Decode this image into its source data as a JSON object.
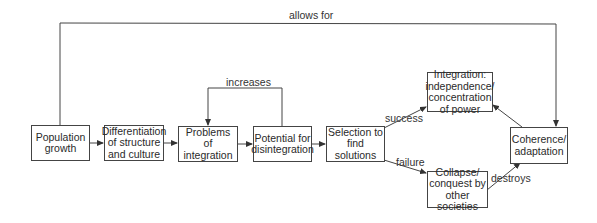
{
  "diagram": {
    "type": "flowchart",
    "nodes": {
      "population": "Population growth",
      "differentiation": "Differentiation of structure and culture",
      "problems": "Problems of integration",
      "potential": "Potential for disintegration",
      "selection": "Selection to find solutions",
      "integration": "Integration: independence/ concentration of power",
      "coherence": "Coherence/ adaptation",
      "collapse": "Collapse/ conquest by other societies"
    },
    "edge_labels": {
      "allows_for": "allows for",
      "increases": "increases",
      "success": "success",
      "failure": "failure",
      "destroys": "destroys"
    },
    "edges": [
      {
        "from": "Population growth",
        "to": "Differentiation of structure and culture"
      },
      {
        "from": "Differentiation of structure and culture",
        "to": "Problems of integration"
      },
      {
        "from": "Problems of integration",
        "to": "Potential for disintegration"
      },
      {
        "from": "Potential for disintegration",
        "to": "Problems of integration",
        "label": "increases"
      },
      {
        "from": "Potential for disintegration",
        "to": "Selection to find solutions"
      },
      {
        "from": "Selection to find solutions",
        "to": "Integration: independence/ concentration of power",
        "label": "success"
      },
      {
        "from": "Selection to find solutions",
        "to": "Collapse/ conquest by other societies",
        "label": "failure"
      },
      {
        "from": "Population growth",
        "to": "Coherence/ adaptation",
        "label": "allows for"
      },
      {
        "from": "Coherence/ adaptation",
        "to": "Integration: independence/ concentration of power"
      },
      {
        "from": "Collapse/ conquest by other societies",
        "to": "Coherence/ adaptation",
        "label": "destroys"
      }
    ]
  }
}
